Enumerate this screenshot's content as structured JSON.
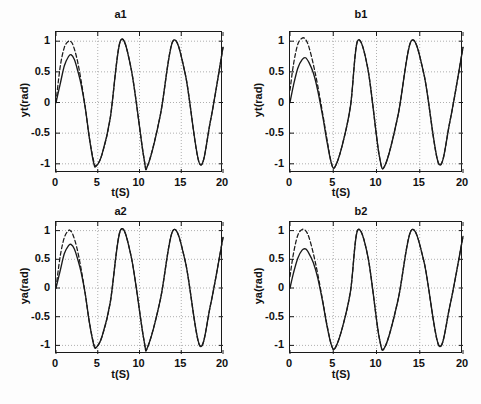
{
  "figure": {
    "background_color": "#fdfdfd",
    "line_color": "#1a1a1a",
    "grid_color": "#9a9a9a",
    "axis_color": "#1a1a1a"
  },
  "chart_data": [
    {
      "id": "a1",
      "type": "line",
      "title": "a1",
      "xlabel": "t(S)",
      "ylabel": "yt(rad)",
      "xlim": [
        0,
        20
      ],
      "ylim": [
        -1.15,
        1.15
      ],
      "xticks": [
        0,
        5,
        10,
        15,
        20
      ],
      "xticklabels": [
        "0",
        "5",
        "10",
        "15",
        "20"
      ],
      "yticks": [
        -1,
        -0.5,
        0,
        0.5,
        1
      ],
      "yticklabels": [
        "-1",
        "-0.5",
        "0",
        "0.5",
        "1"
      ],
      "grid": true,
      "legend": null,
      "series": [
        {
          "name": "reference",
          "style": "dashed",
          "description": "reference sine, reaches +1 peak near t=1.7",
          "y0": 0.0,
          "amplitude": 1.0,
          "period": 6.3,
          "phase": 0.0,
          "transient_gain": 1.0,
          "transient_tau": 1.2,
          "x": [
            0,
            0.5,
            1,
            1.5,
            1.7,
            2,
            2.5,
            3,
            3.5,
            4,
            4.5,
            4.8,
            5.5,
            6.5,
            7.7,
            9,
            10.5,
            11,
            12.5,
            14,
            15.5,
            17.2,
            18.5,
            20
          ],
          "y": [
            0,
            0.58,
            0.9,
            1.0,
            1.0,
            0.95,
            0.72,
            0.36,
            -0.08,
            -0.58,
            -0.95,
            -1.03,
            -0.85,
            -0.25,
            1.0,
            0.55,
            -0.88,
            -1.02,
            -0.2,
            1.0,
            0.45,
            -1.0,
            -0.3,
            0.9
          ]
        },
        {
          "name": "output",
          "style": "solid",
          "description": "system output, first peak damped to about 0.78",
          "y0": 0.0,
          "amplitude": 1.0,
          "period": 6.3,
          "phase": 0.0,
          "first_peak": 0.78,
          "x": [
            0,
            0.5,
            1,
            1.5,
            1.8,
            2.2,
            2.6,
            3,
            3.5,
            4,
            4.5,
            4.8,
            5.5,
            6.5,
            7.7,
            9,
            10.5,
            11,
            12.5,
            14,
            15.5,
            17.2,
            18.5,
            20
          ],
          "y": [
            0,
            0.3,
            0.6,
            0.75,
            0.78,
            0.7,
            0.52,
            0.3,
            -0.08,
            -0.58,
            -0.98,
            -1.04,
            -0.85,
            -0.25,
            1.0,
            0.55,
            -0.88,
            -1.02,
            -0.2,
            1.0,
            0.45,
            -1.0,
            -0.3,
            0.9
          ]
        }
      ]
    },
    {
      "id": "b1",
      "type": "line",
      "title": "b1",
      "xlabel": "t(S)",
      "ylabel": "yt(rad)",
      "xlim": [
        0,
        20
      ],
      "ylim": [
        -1.15,
        1.15
      ],
      "xticks": [
        0,
        5,
        10,
        15,
        20
      ],
      "xticklabels": [
        "0",
        "5",
        "10",
        "15",
        "20"
      ],
      "yticks": [
        -1,
        -0.5,
        0,
        0.5,
        1
      ],
      "yticklabels": [
        "-1",
        "-0.5",
        "0",
        "0.5",
        "1"
      ],
      "grid": true,
      "legend": null,
      "series": [
        {
          "name": "reference",
          "style": "dashed",
          "description": "reference sine starting near 0.2, overshoot to +1.05",
          "y0": 0.2,
          "amplitude": 1.0,
          "period": 6.3,
          "phase": 0.0,
          "x": [
            0,
            0.4,
            0.9,
            1.4,
            1.8,
            2.2,
            2.7,
            3.2,
            3.8,
            4.3,
            4.8,
            5.2,
            6,
            7,
            7.8,
            9,
            10.3,
            11,
            12.5,
            14,
            15.5,
            17.2,
            18.5,
            20
          ],
          "y": [
            0.2,
            0.62,
            0.95,
            1.05,
            1.03,
            0.9,
            0.62,
            0.28,
            -0.2,
            -0.62,
            -1.0,
            -1.05,
            -0.72,
            -0.05,
            1.0,
            0.55,
            -0.85,
            -1.02,
            -0.2,
            1.0,
            0.45,
            -1.0,
            -0.3,
            0.9
          ]
        },
        {
          "name": "output",
          "style": "solid",
          "description": "system output, first peak damped to about 0.73",
          "y0": 0.0,
          "amplitude": 1.0,
          "period": 6.3,
          "phase": 0.0,
          "first_peak": 0.73,
          "x": [
            0,
            0.4,
            0.9,
            1.4,
            1.8,
            2.2,
            2.7,
            3.2,
            3.8,
            4.3,
            4.8,
            5.2,
            6,
            7,
            7.8,
            9,
            10.3,
            11,
            12.5,
            14,
            15.5,
            17.2,
            18.5,
            20
          ],
          "y": [
            0,
            0.28,
            0.56,
            0.7,
            0.73,
            0.65,
            0.48,
            0.2,
            -0.24,
            -0.66,
            -1.0,
            -1.05,
            -0.72,
            -0.05,
            1.0,
            0.55,
            -0.85,
            -1.02,
            -0.2,
            1.0,
            0.45,
            -1.0,
            -0.3,
            0.9
          ]
        }
      ]
    },
    {
      "id": "a2",
      "type": "line",
      "title": "a2",
      "xlabel": "t(S)",
      "ylabel": "ya(rad)",
      "xlim": [
        0,
        20
      ],
      "ylim": [
        -1.15,
        1.15
      ],
      "xticks": [
        0,
        5,
        10,
        15,
        20
      ],
      "xticklabels": [
        "0",
        "5",
        "10",
        "15",
        "20"
      ],
      "yticks": [
        -1,
        -0.5,
        0,
        0.5,
        1
      ],
      "yticklabels": [
        "-1",
        "-0.5",
        "0",
        "0.5",
        "1"
      ],
      "grid": true,
      "legend": null,
      "series": [
        {
          "name": "reference",
          "style": "dashed",
          "description": "reference sine, peak +1 near t=1.7",
          "y0": 0.0,
          "amplitude": 1.0,
          "period": 6.3,
          "phase": 0.0,
          "x": [
            0,
            0.5,
            1,
            1.5,
            1.7,
            2,
            2.5,
            3,
            3.5,
            4,
            4.5,
            4.8,
            5.5,
            6.5,
            7.7,
            9,
            10.5,
            11,
            12.5,
            14,
            15.5,
            17.2,
            18.5,
            20
          ],
          "y": [
            0,
            0.55,
            0.88,
            1.0,
            1.0,
            0.94,
            0.7,
            0.34,
            -0.1,
            -0.6,
            -0.96,
            -1.03,
            -0.85,
            -0.25,
            1.0,
            0.55,
            -0.88,
            -1.02,
            -0.2,
            1.0,
            0.45,
            -1.0,
            -0.3,
            0.88
          ]
        },
        {
          "name": "output",
          "style": "solid",
          "description": "system output, first peak about 0.76",
          "y0": 0.0,
          "amplitude": 1.0,
          "period": 6.3,
          "phase": 0.0,
          "first_peak": 0.76,
          "x": [
            0,
            0.5,
            1,
            1.5,
            1.8,
            2.2,
            2.6,
            3,
            3.5,
            4,
            4.5,
            4.8,
            5.5,
            6.5,
            7.7,
            9,
            10.5,
            11,
            12.5,
            14,
            15.5,
            17.2,
            18.5,
            20
          ],
          "y": [
            0,
            0.3,
            0.6,
            0.74,
            0.76,
            0.68,
            0.5,
            0.28,
            -0.1,
            -0.6,
            -0.98,
            -1.04,
            -0.85,
            -0.25,
            1.0,
            0.55,
            -0.88,
            -1.02,
            -0.2,
            1.0,
            0.45,
            -1.0,
            -0.3,
            0.88
          ]
        }
      ]
    },
    {
      "id": "b2",
      "type": "line",
      "title": "b2",
      "xlabel": "t(S)",
      "ylabel": "ya(rad)",
      "xlim": [
        0,
        20
      ],
      "ylim": [
        -1.15,
        1.15
      ],
      "xticks": [
        0,
        5,
        10,
        15,
        20
      ],
      "xticklabels": [
        "0",
        "5",
        "10",
        "15",
        "20"
      ],
      "yticks": [
        -1,
        -0.5,
        0,
        0.5,
        1
      ],
      "yticklabels": [
        "-1",
        "-0.5",
        "0",
        "0.5",
        "1"
      ],
      "grid": true,
      "legend": null,
      "series": [
        {
          "name": "reference",
          "style": "dashed",
          "description": "reference sine starting near 0.2, overshoot to +1.02",
          "y0": 0.2,
          "amplitude": 1.0,
          "period": 6.3,
          "phase": 0.0,
          "x": [
            0,
            0.4,
            0.9,
            1.4,
            1.8,
            2.2,
            2.7,
            3.2,
            3.8,
            4.3,
            4.8,
            5.2,
            6,
            7,
            7.8,
            9,
            10.3,
            11,
            12.5,
            14,
            15.5,
            17.2,
            18.5,
            20
          ],
          "y": [
            0.2,
            0.6,
            0.92,
            1.02,
            1.0,
            0.88,
            0.6,
            0.25,
            -0.24,
            -0.66,
            -1.0,
            -1.05,
            -0.72,
            -0.05,
            1.0,
            0.55,
            -0.85,
            -1.02,
            -0.2,
            1.0,
            0.45,
            -1.0,
            -0.3,
            0.9
          ]
        },
        {
          "name": "output",
          "style": "solid",
          "description": "system output, first peak about 0.68",
          "y0": 0.0,
          "amplitude": 1.0,
          "period": 6.3,
          "phase": 0.0,
          "first_peak": 0.68,
          "x": [
            0,
            0.4,
            0.9,
            1.4,
            1.8,
            2.2,
            2.7,
            3.2,
            3.8,
            4.3,
            4.8,
            5.2,
            6,
            7,
            7.8,
            9,
            10.3,
            11,
            12.5,
            14,
            15.5,
            17.2,
            18.5,
            20
          ],
          "y": [
            0,
            0.26,
            0.52,
            0.66,
            0.68,
            0.6,
            0.44,
            0.18,
            -0.26,
            -0.68,
            -1.0,
            -1.05,
            -0.72,
            -0.05,
            1.0,
            0.55,
            -0.85,
            -1.02,
            -0.2,
            1.0,
            0.45,
            -1.0,
            -0.3,
            0.9
          ]
        }
      ]
    }
  ]
}
